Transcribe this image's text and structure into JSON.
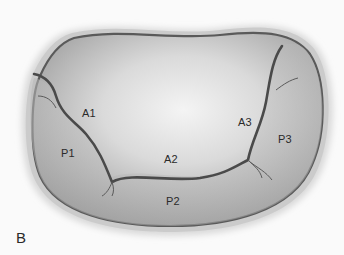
{
  "figure": {
    "panel_label": "B",
    "labels": {
      "A1": "A1",
      "A2": "A2",
      "A3": "A3",
      "P1": "P1",
      "P2": "P2",
      "P3": "P3"
    },
    "colors": {
      "background": "#fafafa",
      "annulus_halo": "#d4d4d4",
      "annulus_line": "#5a5a5a",
      "leaflet_center": "#efefef",
      "leaflet_edge": "#9a9a9a",
      "coaptation_line": "#4a4a4a"
    }
  }
}
